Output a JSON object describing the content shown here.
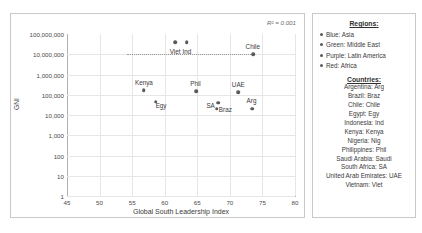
{
  "chart_data": {
    "type": "scatter",
    "title": "",
    "xlabel": "Global South Leadership Index",
    "ylabel": "GNI",
    "xlim": [
      45,
      80
    ],
    "ylim": [
      1,
      100000000
    ],
    "yscale": "log",
    "xticks": [
      "45",
      "50",
      "55",
      "60",
      "65",
      "70",
      "75",
      "80"
    ],
    "yticks": [
      "100,000,000",
      "10,000,000",
      "1,000,000",
      "100,000",
      "10,000",
      "1,000",
      "100",
      "10",
      "1"
    ],
    "grid": true,
    "annotation": "R² = 0.001",
    "trendline": {
      "type": "linear",
      "y_value": 10000000,
      "style": "dotted"
    },
    "points": [
      {
        "label": "Viet",
        "x": 61.6,
        "y": 40000000,
        "label_dx": 0,
        "label_dy": 8.5
      },
      {
        "label": "Ind",
        "x": 63.4,
        "y": 40000000,
        "label_dx": 0,
        "label_dy": 8.5
      },
      {
        "label": "Chile",
        "x": 73.6,
        "y": 10000000,
        "label_dx": -0.5,
        "label_dy": -8.5
      },
      {
        "label": "Kenya",
        "x": 56.8,
        "y": 170000,
        "label_dx": 0,
        "label_dy": -8.5
      },
      {
        "label": "Egy",
        "x": 58.6,
        "y": 45000,
        "label_dx": 5.5,
        "label_dy": 3.5
      },
      {
        "label": "Phil",
        "x": 64.8,
        "y": 150000,
        "label_dx": -0.5,
        "label_dy": -8.5
      },
      {
        "label": "SA",
        "x": 68.2,
        "y": 40000,
        "label_dx": -7.5,
        "label_dy": 2.0
      },
      {
        "label": "Braz",
        "x": 68.0,
        "y": 20000,
        "label_dx": 8.5,
        "label_dy": 0
      },
      {
        "label": "UAE",
        "x": 71.3,
        "y": 130000,
        "label_dx": 0,
        "label_dy": -8.5
      },
      {
        "label": "Arg",
        "x": 73.4,
        "y": 20000,
        "label_dx": -0.5,
        "label_dy": -8.5
      },
      {
        "label": "Nig",
        "x": 0,
        "y": 0,
        "hidden": true
      }
    ]
  },
  "legend": {
    "regions_title": "Regions:",
    "regions": [
      {
        "label": "Blue: Asia"
      },
      {
        "label": "Green: Middle East"
      },
      {
        "label": "Purple: Latin America"
      },
      {
        "label": "Red: Africa"
      }
    ],
    "countries_title": "Countries:",
    "countries": [
      "Argentina: Arg",
      "Brazil: Braz",
      "Chile: Chile",
      "Egypt: Egy",
      "Indonesia: Ind",
      "Kenya: Kenya",
      "Nigeria: Nig",
      "Philippines: Phil",
      "Saudi Arabia: Saudi",
      "South Africa: SA",
      "United Arab Emirates: UAE",
      "Vietnam: Viet"
    ]
  },
  "colors": {
    "marker": "#5a5a5a",
    "grid": "#e6e6e6",
    "axis": "#b0b0b0",
    "border": "#c9c9c9",
    "text": "#3a3a3a"
  }
}
